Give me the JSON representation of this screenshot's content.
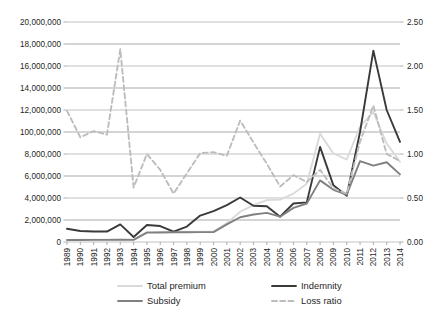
{
  "chart_data": {
    "type": "line",
    "title": "",
    "subtitle": "",
    "xlabel": "",
    "ylabel": "",
    "y2label": "",
    "grid": true,
    "legend_position": "bottom",
    "categories": [
      "1989",
      "1990",
      "1991",
      "1992",
      "1993",
      "1994",
      "1995",
      "1996",
      "1997",
      "1998",
      "1999",
      "2000",
      "2001",
      "2002",
      "2003",
      "2004",
      "2005",
      "2006",
      "2007",
      "2008",
      "2009",
      "2010",
      "2011",
      "2012",
      "2013",
      "2014"
    ],
    "ylim": [
      0,
      20000000
    ],
    "ytick_values": [
      0,
      2000000,
      4000000,
      6000000,
      8000000,
      10000000,
      12000000,
      14000000,
      16000000,
      18000000,
      20000000
    ],
    "ytick_labels": [
      "0",
      "2,000,000",
      "4,000,000",
      "6,000,000",
      "8,000,000",
      "100,00,000",
      "12,000,000",
      "14,000,000",
      "16,000,000",
      "18,000,000",
      "20,000,000"
    ],
    "y2lim": [
      0,
      2.5
    ],
    "y2tick_values": [
      0.0,
      0.5,
      1.0,
      1.5,
      2.0,
      2.5
    ],
    "y2tick_labels": [
      "0.00",
      "0.50",
      "1.00",
      "1.50",
      "2.00",
      "2.50"
    ],
    "y2_minor_gridlines": [
      0.25,
      0.75,
      1.25,
      1.75,
      2.25
    ],
    "series": [
      {
        "name": "Total premium",
        "axis": "left",
        "color": "#d9d9d9",
        "style": "solid",
        "width": 1.8,
        "values": [
          200000,
          210000,
          215000,
          220000,
          225000,
          215000,
          900000,
          920000,
          930000,
          935000,
          940000,
          945000,
          1700000,
          2750000,
          3350000,
          3800000,
          3850000,
          4400000,
          5300000,
          9850000,
          8050000,
          7500000,
          10500000,
          11800000,
          8950000,
          7300000
        ]
      },
      {
        "name": "Indemnity",
        "axis": "left",
        "color": "#3a3a3a",
        "style": "solid",
        "width": 1.9,
        "values": [
          1200000,
          1000000,
          950000,
          950000,
          1600000,
          450000,
          1550000,
          1450000,
          950000,
          1400000,
          2400000,
          2800000,
          3350000,
          4050000,
          3300000,
          3250000,
          2300000,
          3500000,
          3600000,
          8650000,
          5150000,
          4200000,
          10000000,
          17400000,
          12000000,
          9100000
        ]
      },
      {
        "name": "Subsidy",
        "axis": "left",
        "color": "#808080",
        "style": "solid",
        "width": 1.9,
        "values": [
          180000,
          185000,
          190000,
          195000,
          200000,
          190000,
          850000,
          870000,
          880000,
          890000,
          895000,
          900000,
          1600000,
          2250000,
          2500000,
          2650000,
          2300000,
          3100000,
          3500000,
          5600000,
          4750000,
          4300000,
          7350000,
          6950000,
          7250000,
          6150000
        ]
      },
      {
        "name": "Loss ratio",
        "axis": "right",
        "color": "#bdbdbd",
        "style": "dashed",
        "width": 1.9,
        "values": [
          1.49,
          1.19,
          1.26,
          1.22,
          2.19,
          0.62,
          1.0,
          0.82,
          0.55,
          0.78,
          1.01,
          1.02,
          0.98,
          1.38,
          1.13,
          0.89,
          0.63,
          0.76,
          0.68,
          0.82,
          0.61,
          0.55,
          1.14,
          1.55,
          1.0,
          0.92
        ]
      }
    ]
  },
  "legend": {
    "items": [
      {
        "label": "Total premium",
        "color": "#d9d9d9",
        "style": "solid"
      },
      {
        "label": "Indemnity",
        "color": "#3a3a3a",
        "style": "solid"
      },
      {
        "label": "Subsidy",
        "color": "#808080",
        "style": "solid"
      },
      {
        "label": "Loss ratio",
        "color": "#bdbdbd",
        "style": "dashed"
      }
    ]
  }
}
